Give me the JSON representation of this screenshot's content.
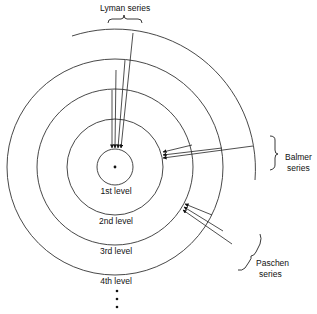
{
  "diagram": {
    "levels": [
      {
        "label": "1st level"
      },
      {
        "label": "2nd level"
      },
      {
        "label": "3rd level"
      },
      {
        "label": "4th level"
      }
    ],
    "continuation": "⋮",
    "series": [
      {
        "name": "Lyman",
        "label_line1": "Lyman series",
        "label_line2": "",
        "target_level": 1,
        "transitions": 4
      },
      {
        "name": "Balmer",
        "label_line1": "Balmer",
        "label_line2": "series",
        "target_level": 2,
        "transitions": 3
      },
      {
        "name": "Paschen",
        "label_line1": "Paschen",
        "label_line2": "series",
        "target_level": 3,
        "transitions": 3
      }
    ],
    "colors": {
      "line": "#222222",
      "background": "#ffffff"
    }
  }
}
